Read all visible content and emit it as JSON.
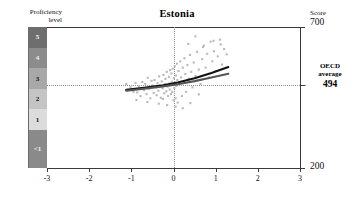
{
  "chart_data": {
    "type": "scatter",
    "title": "Estonia",
    "xlabel": "PISA index of economic, social and cultural status",
    "ylabel": "Score",
    "xlim": [
      -3,
      3
    ],
    "ylim": [
      200,
      700
    ],
    "xticks": [
      "-3",
      "-2",
      "-1",
      "0",
      "1",
      "2",
      "3"
    ],
    "xtick_values": [
      -3,
      -2,
      -1,
      0,
      1,
      2,
      3
    ],
    "grid": "dotted reference lines at x=0 and y=494",
    "reference_lines": [
      {
        "orientation": "vertical",
        "value": 0,
        "style": "dotted"
      },
      {
        "orientation": "horizontal",
        "value": 494,
        "style": "dotted",
        "label": "OECD average"
      }
    ],
    "y_axis_top_label": "700",
    "y_axis_bottom_label": "200",
    "proficiency_bands": [
      {
        "label": "5",
        "y_from": 626,
        "y_to": 700,
        "color": "#6e6e6e",
        "text_color": "light"
      },
      {
        "label": "4",
        "y_from": 553,
        "y_to": 626,
        "color": "#8c8c8c",
        "text_color": "light"
      },
      {
        "label": "3",
        "y_from": 481,
        "y_to": 553,
        "color": "#a8a8a8",
        "text_color": "dark"
      },
      {
        "label": "2",
        "y_from": 408,
        "y_to": 481,
        "color": "#c4c4c4",
        "text_color": "dark"
      },
      {
        "label": "1",
        "y_from": 335,
        "y_to": 408,
        "color": "#dcdcdc",
        "text_color": "dark"
      },
      {
        "label": "<1",
        "y_from": 200,
        "y_to": 335,
        "color": "#8a8a8a",
        "text_color": "light"
      }
    ],
    "series": [
      {
        "name": "students",
        "marker": "square",
        "color": "#b9b9b9",
        "points": [
          [
            -1.02,
            487
          ],
          [
            -0.95,
            470
          ],
          [
            -0.9,
            502
          ],
          [
            -0.86,
            468
          ],
          [
            -0.82,
            489
          ],
          [
            -0.78,
            455
          ],
          [
            -0.74,
            505
          ],
          [
            -0.7,
            476
          ],
          [
            -0.67,
            498
          ],
          [
            -0.64,
            462
          ],
          [
            -0.61,
            520
          ],
          [
            -0.58,
            481
          ],
          [
            -0.55,
            447
          ],
          [
            -0.52,
            509
          ],
          [
            -0.5,
            493
          ],
          [
            -0.47,
            466
          ],
          [
            -0.45,
            512
          ],
          [
            -0.42,
            486
          ],
          [
            -0.4,
            458
          ],
          [
            -0.38,
            501
          ],
          [
            -0.36,
            474
          ],
          [
            -0.34,
            525
          ],
          [
            -0.32,
            492
          ],
          [
            -0.3,
            449
          ],
          [
            -0.28,
            507
          ],
          [
            -0.26,
            483
          ],
          [
            -0.24,
            530
          ],
          [
            -0.22,
            465
          ],
          [
            -0.2,
            498
          ],
          [
            -0.19,
            516
          ],
          [
            -0.17,
            472
          ],
          [
            -0.16,
            541
          ],
          [
            -0.14,
            489
          ],
          [
            -0.13,
            455
          ],
          [
            -0.11,
            523
          ],
          [
            -0.1,
            500
          ],
          [
            -0.09,
            478
          ],
          [
            -0.08,
            547
          ],
          [
            -0.07,
            493
          ],
          [
            -0.06,
            462
          ],
          [
            -0.05,
            535
          ],
          [
            -0.04,
            506
          ],
          [
            -0.03,
            470
          ],
          [
            -0.02,
            552
          ],
          [
            -0.01,
            497
          ],
          [
            0.0,
            440
          ],
          [
            0.01,
            519
          ],
          [
            0.02,
            484
          ],
          [
            0.03,
            561
          ],
          [
            0.04,
            503
          ],
          [
            0.05,
            447
          ],
          [
            0.06,
            528
          ],
          [
            0.07,
            491
          ],
          [
            0.08,
            570
          ],
          [
            0.09,
            512
          ],
          [
            0.1,
            432
          ],
          [
            0.12,
            544
          ],
          [
            0.14,
            499
          ],
          [
            0.16,
            578
          ],
          [
            0.18,
            521
          ],
          [
            0.2,
            455
          ],
          [
            0.22,
            556
          ],
          [
            0.24,
            508
          ],
          [
            0.26,
            589
          ],
          [
            0.28,
            533
          ],
          [
            0.3,
            470
          ],
          [
            0.33,
            565
          ],
          [
            0.36,
            517
          ],
          [
            0.39,
            601
          ],
          [
            0.42,
            541
          ],
          [
            0.45,
            486
          ],
          [
            0.48,
            574
          ],
          [
            0.52,
            526
          ],
          [
            0.56,
            612
          ],
          [
            0.6,
            549
          ],
          [
            0.64,
            498
          ],
          [
            0.68,
            586
          ],
          [
            0.72,
            634
          ],
          [
            0.76,
            556
          ],
          [
            0.8,
            605
          ],
          [
            0.84,
            521
          ],
          [
            0.88,
            648
          ],
          [
            0.92,
            578
          ],
          [
            0.96,
            614
          ],
          [
            1.0,
            544
          ],
          [
            1.05,
            596
          ],
          [
            1.1,
            655
          ],
          [
            1.15,
            567
          ],
          [
            1.2,
            622
          ],
          [
            1.26,
            603
          ],
          [
            -1.12,
            498
          ],
          [
            -0.88,
            441
          ],
          [
            -0.62,
            434
          ],
          [
            -0.35,
            428
          ],
          [
            -0.15,
            423
          ],
          [
            0.05,
            418
          ],
          [
            0.22,
            412
          ],
          [
            0.4,
            430
          ],
          [
            -0.25,
            445
          ],
          [
            0.6,
            461
          ],
          [
            0.35,
            640
          ],
          [
            0.52,
            667
          ],
          [
            0.7,
            629
          ],
          [
            0.95,
            651
          ],
          [
            1.12,
            638
          ]
        ]
      }
    ],
    "trend_lines": [
      {
        "name": "curve-upper",
        "color": "#111111",
        "points": [
          [
            -1.12,
            477
          ],
          [
            -0.7,
            484
          ],
          [
            -0.3,
            492
          ],
          [
            0.1,
            503
          ],
          [
            0.5,
            518
          ],
          [
            0.9,
            537
          ],
          [
            1.3,
            558
          ]
        ]
      },
      {
        "name": "curve-lower",
        "color": "#555555",
        "points": [
          [
            -1.12,
            474
          ],
          [
            -0.7,
            481
          ],
          [
            -0.3,
            488
          ],
          [
            0.1,
            497
          ],
          [
            0.5,
            508
          ],
          [
            0.9,
            521
          ],
          [
            1.3,
            534
          ]
        ]
      }
    ]
  },
  "labels": {
    "proficiency_level": "Proficiency\nlevel",
    "proficiency_level_line1": "Proficiency",
    "proficiency_level_line2": "level",
    "score_caption": "Score",
    "score_top": "700",
    "score_bottom": "200",
    "oecd_line1": "OECD",
    "oecd_line2": "average",
    "oecd_value": "494",
    "title": "Estonia",
    "xaxis_title": "PISA index of economic, social and cultural status"
  }
}
